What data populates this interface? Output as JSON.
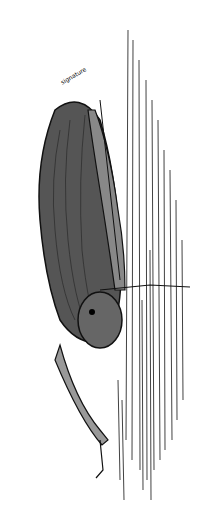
{
  "image": {
    "subject": "pen-and-ink drawing of a bat clinging to a tree trunk",
    "style": "black line hatching on white",
    "signature": "illegible handwritten signature",
    "colors": {
      "ink": "#111111",
      "paper": "#ffffff"
    }
  }
}
